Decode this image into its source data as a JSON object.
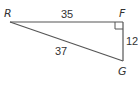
{
  "diagram": {
    "type": "right-triangle",
    "vertices": {
      "R": {
        "label": "R"
      },
      "F": {
        "label": "F"
      },
      "G": {
        "label": "G"
      }
    },
    "sides": {
      "RF": {
        "label": "35"
      },
      "FG": {
        "label": "12"
      },
      "RG": {
        "label": "37"
      }
    },
    "right_angle_at": "F",
    "colors": {
      "stroke": "#555555",
      "text": "#333333"
    }
  }
}
